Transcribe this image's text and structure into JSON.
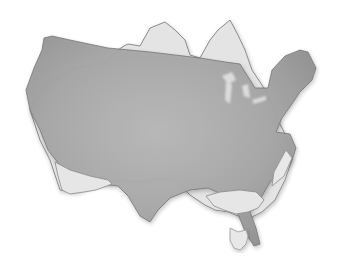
{
  "image": {
    "subject": "Size comparison overlay of the United States map silhouette over the Australia map silhouette",
    "background_color": "#ffffff",
    "regions": [
      {
        "name": "usa",
        "fill_center": "#a9a9a9",
        "fill_edge": "#c8c8c8"
      },
      {
        "name": "australia-visible-parts",
        "fill": "#e6e6e6",
        "outline": "#8a8a8a"
      },
      {
        "name": "overlap",
        "fill": "#9a9a9a"
      },
      {
        "name": "tasmania",
        "fill": "#e8e8e8",
        "outline": "#999999"
      }
    ]
  }
}
